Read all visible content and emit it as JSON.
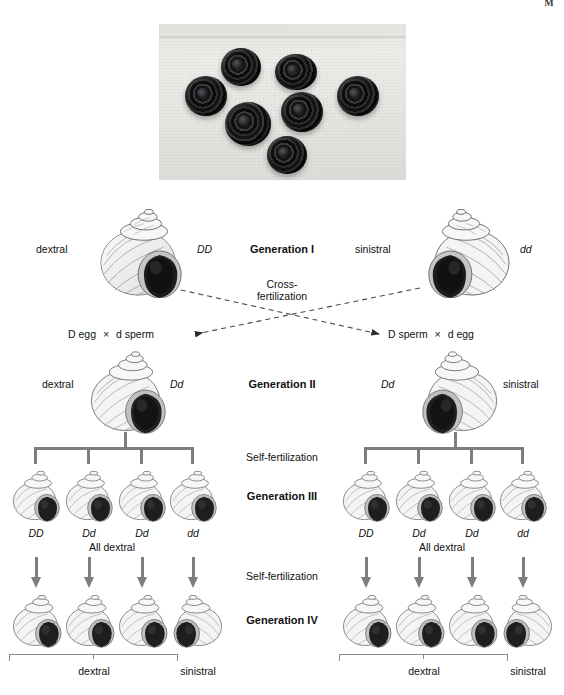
{
  "running_head": "M",
  "photo": {
    "caption": "",
    "shell_count": 7,
    "shells": [
      {
        "left": 26,
        "top": 52,
        "size": 42
      },
      {
        "left": 62,
        "top": 24,
        "size": 40
      },
      {
        "left": 116,
        "top": 30,
        "size": 42
      },
      {
        "left": 66,
        "top": 78,
        "size": 46
      },
      {
        "left": 122,
        "top": 68,
        "size": 42
      },
      {
        "left": 178,
        "top": 52,
        "size": 42
      },
      {
        "left": 108,
        "top": 112,
        "size": 40
      }
    ]
  },
  "generations": {
    "g1": {
      "title": "Generation I",
      "left": {
        "phenotype": "dextral",
        "genotype": "DD"
      },
      "right": {
        "phenotype": "sinistral",
        "genotype": "dd"
      },
      "process": "Cross-\nfertilization",
      "process_line1": "Cross-",
      "process_line2": "fertilization"
    },
    "gametes": {
      "left": {
        "first": "D",
        "first_rest": " egg",
        "operator": "×",
        "second": "d",
        "second_rest": " sperm"
      },
      "right": {
        "first": "D",
        "first_rest": " sperm",
        "operator": "×",
        "second": "d",
        "second_rest": " egg"
      }
    },
    "g2": {
      "title": "Generation II",
      "left": {
        "phenotype": "dextral",
        "genotype": "Dd"
      },
      "right": {
        "phenotype": "sinistral",
        "genotype": "Dd"
      },
      "process": "Self-fertilization"
    },
    "g3": {
      "title": "Generation III",
      "genotypes": [
        "DD",
        "Dd",
        "Dd",
        "dd"
      ],
      "summary": "All dextral",
      "process": "Self-fertilization"
    },
    "g4": {
      "title": "Generation IV",
      "phenotype_group": "dextral",
      "phenotype_single": "sinistral"
    }
  },
  "colors": {
    "bracket_gray": "#7d7d7d",
    "thin_gray": "#8b8b8b",
    "text": "#111111",
    "shell_light": "#f2f2f0",
    "shell_shadow": "#b9b9b7",
    "aperture_dark": "#1b1b1b"
  }
}
